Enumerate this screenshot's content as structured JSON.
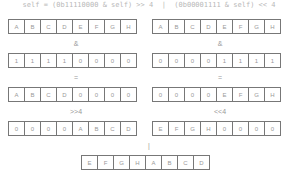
{
  "title": "self = (0b11110000 & self) >> 4  |  (0b00001111 & self) << 4",
  "rows": {
    "r1_left": [
      "A",
      "B",
      "C",
      "D",
      "E",
      "F",
      "G",
      "H"
    ],
    "r1_right": [
      "A",
      "B",
      "C",
      "D",
      "E",
      "F",
      "G",
      "H"
    ],
    "r2_left": [
      "1",
      "1",
      "1",
      "1",
      "0",
      "0",
      "0",
      "0"
    ],
    "r2_right": [
      "0",
      "0",
      "0",
      "0",
      "1",
      "1",
      "1",
      "1"
    ],
    "r3_left": [
      "A",
      "B",
      "C",
      "D",
      "0",
      "0",
      "0",
      "0"
    ],
    "r3_right": [
      "0",
      "0",
      "0",
      "0",
      "E",
      "F",
      "G",
      "H"
    ],
    "r4_left": [
      "0",
      "0",
      "0",
      "0",
      "A",
      "B",
      "C",
      "D"
    ],
    "r4_right": [
      "E",
      "F",
      "G",
      "H",
      "0",
      "0",
      "0",
      "0"
    ],
    "result": [
      "E",
      "F",
      "G",
      "H",
      "A",
      "B",
      "C",
      "D"
    ]
  },
  "operators": {
    "and_left": "&",
    "and_right": "&",
    "eq_left": "=",
    "eq_right": "=",
    "shift_left": ">>4",
    "shift_right": "<<4",
    "or": "|"
  }
}
